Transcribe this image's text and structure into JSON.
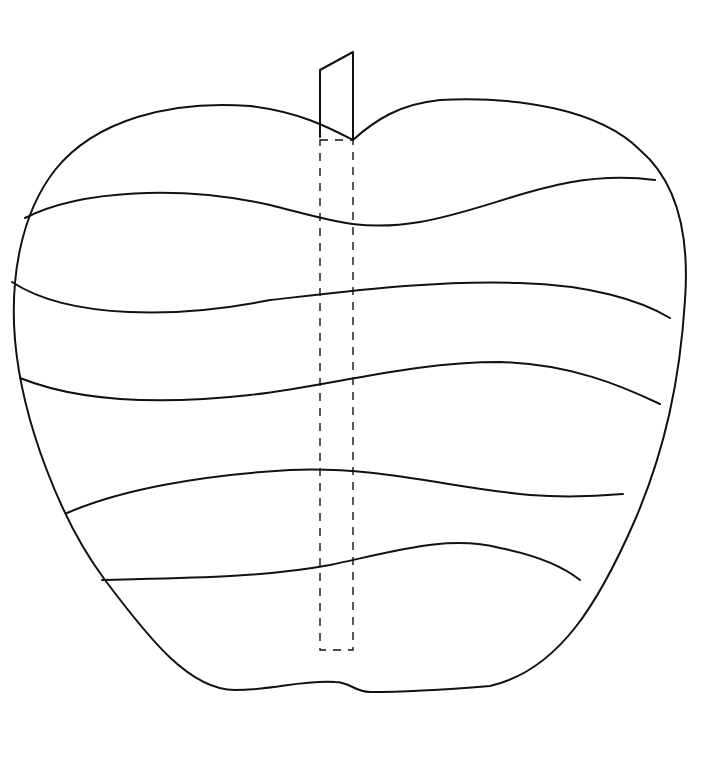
{
  "drawing": {
    "subject": "apple",
    "style": "line-art coloring outline",
    "colors": {
      "background": "#ffffff",
      "line": "#111111"
    },
    "band_count": 6,
    "has_stem": true,
    "has_dashed_core_guide": true
  }
}
